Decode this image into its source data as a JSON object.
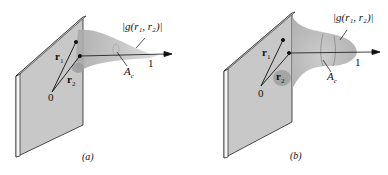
{
  "panels": [
    {
      "id": "a",
      "caption": "(a)",
      "function_label": "|g(r₁, r₂)|",
      "vector_1": "r",
      "vector_1_sub": "1",
      "vector_2": "r",
      "vector_2_sub": "2",
      "origin": "0",
      "axis_end": "1",
      "area_label": "A",
      "area_sub": "c",
      "shape": "narrow-spike"
    },
    {
      "id": "b",
      "caption": "(b)",
      "function_label": "|g(r₁, r₂)|",
      "vector_1": "r",
      "vector_1_sub": "1",
      "vector_2": "r",
      "vector_2_sub": "2",
      "origin": "0",
      "axis_end": "1",
      "area_label": "A",
      "area_sub": "c",
      "shape": "broad-bell"
    }
  ],
  "colors": {
    "plate": "#c8c8c8",
    "plate_edge": "#f4f4f4",
    "surface": "#b9b9b9",
    "ink": "#111111"
  }
}
